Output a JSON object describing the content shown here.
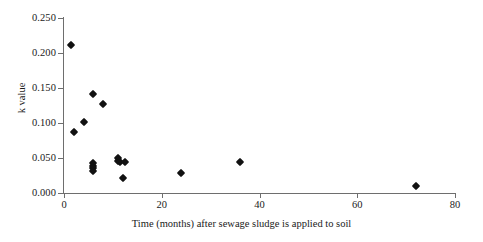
{
  "chart_data": {
    "type": "scatter",
    "title": "",
    "xlabel": "Time (months) after sewage sludge is applied to soil",
    "ylabel": "k value",
    "xlim": [
      0,
      80
    ],
    "ylim": [
      0.0,
      0.25
    ],
    "xticks": [
      0,
      20,
      40,
      60,
      80
    ],
    "xtick_labels": [
      "0",
      "20",
      "40",
      "60",
      "80"
    ],
    "yticks": [
      0.0,
      0.05,
      0.1,
      0.15,
      0.2,
      0.25
    ],
    "ytick_labels": [
      "0.000",
      "0.050",
      "0.100",
      "0.150",
      "0.200",
      "0.250"
    ],
    "grid": false,
    "legend": false,
    "marker_shape": "diamond",
    "marker_color": "#111111",
    "axis_color": "#6e6e6e",
    "series": [
      {
        "name": "k value vs time",
        "points": [
          {
            "x": 1.5,
            "y": 0.212
          },
          {
            "x": 2.0,
            "y": 0.087
          },
          {
            "x": 4.0,
            "y": 0.102
          },
          {
            "x": 6.0,
            "y": 0.141
          },
          {
            "x": 8.0,
            "y": 0.127
          },
          {
            "x": 6.0,
            "y": 0.043
          },
          {
            "x": 6.0,
            "y": 0.039
          },
          {
            "x": 6.0,
            "y": 0.036
          },
          {
            "x": 6.0,
            "y": 0.032
          },
          {
            "x": 11.0,
            "y": 0.05
          },
          {
            "x": 11.0,
            "y": 0.046
          },
          {
            "x": 11.5,
            "y": 0.045
          },
          {
            "x": 12.5,
            "y": 0.045
          },
          {
            "x": 12.0,
            "y": 0.022
          },
          {
            "x": 24.0,
            "y": 0.028
          },
          {
            "x": 36.0,
            "y": 0.044
          },
          {
            "x": 72.0,
            "y": 0.01
          }
        ]
      }
    ]
  }
}
